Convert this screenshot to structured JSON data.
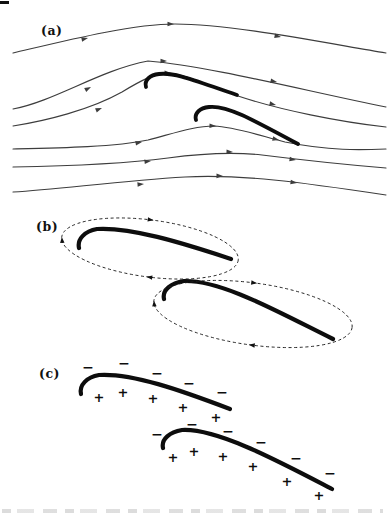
{
  "figure": {
    "panels": [
      {
        "id": "a",
        "label": "(a)"
      },
      {
        "id": "b",
        "label": "(b)"
      },
      {
        "id": "c",
        "label": "(c)"
      }
    ]
  },
  "charges": {
    "minus_symbol": "−",
    "plus_symbol": "+",
    "airfoil1": {
      "minus": [
        [
          88,
          367
        ],
        [
          124,
          363
        ],
        [
          157,
          373
        ],
        [
          189,
          383
        ],
        [
          222,
          392
        ]
      ],
      "plus": [
        [
          99,
          397
        ],
        [
          123,
          392
        ],
        [
          153,
          398
        ],
        [
          183,
          407
        ],
        [
          216,
          417
        ]
      ]
    },
    "airfoil2": {
      "minus": [
        [
          157,
          434
        ],
        [
          192,
          424
        ],
        [
          228,
          431
        ],
        [
          261,
          442
        ],
        [
          296,
          458
        ],
        [
          330,
          473
        ]
      ],
      "plus": [
        [
          173,
          457
        ],
        [
          194,
          451
        ],
        [
          223,
          456
        ],
        [
          253,
          466
        ],
        [
          287,
          481
        ],
        [
          319,
          495
        ]
      ]
    }
  },
  "colors": {
    "ink": "#111111",
    "streamline": "#3d3d3d",
    "background": "#ffffff"
  }
}
